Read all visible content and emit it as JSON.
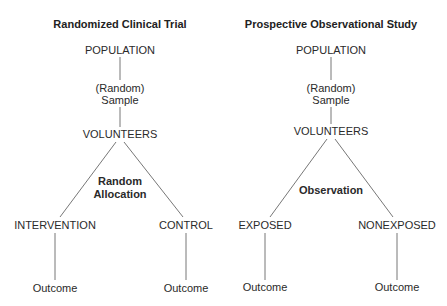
{
  "diagrams": [
    {
      "title": "Randomized Clinical Trial",
      "population": "POPULATION",
      "sample_line1": "(Random)",
      "sample_line2": "Sample",
      "volunteers": "VOLUNTEERS",
      "method_line1": "Random",
      "method_line2": "Allocation",
      "branch_left": "INTERVENTION",
      "branch_right": "CONTROL",
      "outcome_left": "Outcome",
      "outcome_right": "Outcome"
    },
    {
      "title": "Prospective Observational Study",
      "population": "POPULATION",
      "sample_line1": "(Random)",
      "sample_line2": "Sample",
      "volunteers": "VOLUNTEERS",
      "method_line1": "Observation",
      "branch_left": "EXPOSED",
      "branch_right": "NONEXPOSED",
      "outcome_left": "Outcome",
      "outcome_right": "Outcome"
    }
  ],
  "colors": {
    "line": "#777777",
    "text": "#2a2a2a"
  }
}
